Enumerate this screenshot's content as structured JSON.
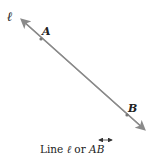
{
  "diagram": {
    "line_label": "ℓ",
    "point_a": "A",
    "point_b": "B",
    "caption": {
      "prefix": "Line ",
      "ell": "ℓ",
      "middle": " or ",
      "ab": "AB"
    },
    "colors": {
      "line": "#8a8a8a",
      "text": "#222222"
    }
  }
}
